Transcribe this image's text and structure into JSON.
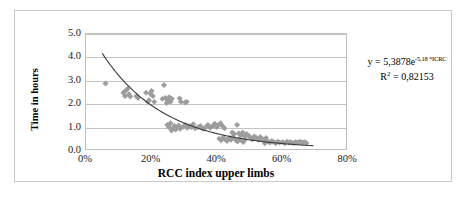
{
  "chart_data": {
    "type": "scatter",
    "title": "",
    "xlabel": "RCC index upper limbs",
    "ylabel": "Time in hours",
    "xlim": [
      0,
      80
    ],
    "ylim": [
      0,
      5
    ],
    "xticks": [
      "0%",
      "20%",
      "40%",
      "60%",
      "80%"
    ],
    "xtick_values": [
      0,
      20,
      40,
      60,
      80
    ],
    "yticks": [
      "0.0",
      "1.0",
      "2.0",
      "3.0",
      "4.0",
      "5.0"
    ],
    "ytick_values": [
      0,
      1,
      2,
      3,
      4,
      5
    ],
    "grid": "horizontal",
    "legend": "none",
    "marker": "diamond",
    "marker_color": "#9d9d9d",
    "series": [
      {
        "name": "RCC index vs time",
        "points": [
          [
            6.0,
            2.85
          ],
          [
            11.5,
            2.45
          ],
          [
            12.0,
            2.3
          ],
          [
            12.3,
            2.55
          ],
          [
            12.8,
            2.62
          ],
          [
            13.2,
            2.38
          ],
          [
            13.6,
            2.28
          ],
          [
            15.5,
            2.3
          ],
          [
            16.0,
            2.22
          ],
          [
            18.5,
            2.45
          ],
          [
            19.0,
            2.05
          ],
          [
            19.4,
            2.12
          ],
          [
            19.8,
            2.4
          ],
          [
            20.2,
            2.52
          ],
          [
            20.6,
            2.3
          ],
          [
            21.0,
            2.05
          ],
          [
            23.5,
            2.18
          ],
          [
            24.0,
            2.78
          ],
          [
            24.4,
            2.22
          ],
          [
            24.8,
            2.0
          ],
          [
            25.2,
            2.1
          ],
          [
            25.6,
            2.25
          ],
          [
            26.0,
            2.05
          ],
          [
            26.4,
            2.18
          ],
          [
            25.0,
            1.05
          ],
          [
            25.5,
            0.95
          ],
          [
            26.0,
            1.12
          ],
          [
            26.3,
            0.8
          ],
          [
            26.8,
            0.9
          ],
          [
            27.2,
            1.0
          ],
          [
            27.6,
            0.85
          ],
          [
            28.0,
            0.95
          ],
          [
            28.5,
            1.02
          ],
          [
            29.0,
            0.88
          ],
          [
            28.8,
            2.2
          ],
          [
            29.2,
            2.05
          ],
          [
            30.5,
            2.02
          ],
          [
            31.0,
            2.05
          ],
          [
            30.0,
            0.98
          ],
          [
            30.6,
            1.05
          ],
          [
            31.2,
            0.92
          ],
          [
            31.8,
            1.0
          ],
          [
            32.4,
            0.95
          ],
          [
            33.0,
            1.08
          ],
          [
            33.6,
            0.9
          ],
          [
            34.5,
            0.95
          ],
          [
            35.2,
            1.0
          ],
          [
            36.0,
            0.88
          ],
          [
            36.8,
            0.95
          ],
          [
            37.5,
            1.05
          ],
          [
            38.2,
            0.92
          ],
          [
            39.0,
            1.0
          ],
          [
            39.6,
            1.1
          ],
          [
            40.2,
            0.95
          ],
          [
            40.8,
            1.05
          ],
          [
            41.4,
            1.12
          ],
          [
            42.0,
            1.0
          ],
          [
            42.6,
            0.9
          ],
          [
            41.0,
            0.45
          ],
          [
            41.6,
            0.38
          ],
          [
            42.2,
            0.5
          ],
          [
            42.8,
            0.42
          ],
          [
            43.4,
            0.35
          ],
          [
            44.0,
            0.48
          ],
          [
            44.6,
            0.4
          ],
          [
            45.2,
            0.52
          ],
          [
            45.0,
            0.72
          ],
          [
            45.6,
            0.65
          ],
          [
            46.5,
            1.05
          ],
          [
            47.0,
            0.68
          ],
          [
            47.6,
            0.6
          ],
          [
            48.2,
            0.72
          ],
          [
            48.8,
            0.55
          ],
          [
            49.4,
            0.65
          ],
          [
            50.0,
            0.58
          ],
          [
            46.0,
            0.4
          ],
          [
            46.6,
            0.32
          ],
          [
            47.2,
            0.45
          ],
          [
            47.8,
            0.38
          ],
          [
            48.4,
            0.3
          ],
          [
            49.0,
            0.42
          ],
          [
            50.6,
            0.5
          ],
          [
            51.2,
            0.42
          ],
          [
            51.8,
            0.55
          ],
          [
            52.4,
            0.48
          ],
          [
            53.0,
            0.4
          ],
          [
            53.6,
            0.52
          ],
          [
            54.2,
            0.45
          ],
          [
            54.8,
            0.38
          ],
          [
            55.4,
            0.48
          ],
          [
            55.0,
            0.25
          ],
          [
            56.0,
            0.32
          ],
          [
            56.6,
            0.28
          ],
          [
            57.2,
            0.35
          ],
          [
            57.8,
            0.3
          ],
          [
            58.4,
            0.25
          ],
          [
            59.0,
            0.32
          ],
          [
            59.6,
            0.28
          ],
          [
            60.5,
            0.3
          ],
          [
            61.2,
            0.25
          ],
          [
            61.8,
            0.32
          ],
          [
            62.4,
            0.28
          ],
          [
            63.0,
            0.3
          ],
          [
            63.8,
            0.26
          ],
          [
            64.5,
            0.3
          ],
          [
            65.2,
            0.28
          ],
          [
            65.8,
            0.32
          ],
          [
            66.5,
            0.28
          ],
          [
            67.2,
            0.3
          ],
          [
            67.8,
            0.26
          ]
        ]
      }
    ],
    "trendline": {
      "type": "exponential",
      "coefficient": 5.3878,
      "exponent": -5.18,
      "r_squared": 0.82153,
      "x_start": 5.0,
      "x_end": 70.0
    },
    "annotation": {
      "equation_prefix": "y = 5,3878e",
      "equation_exponent": "-5,18 *ICRC",
      "r2_label": "R",
      "r2_sup": "2",
      "r2_value": " = 0,82153"
    }
  }
}
